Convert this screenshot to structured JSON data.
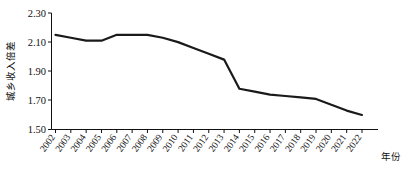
{
  "chart_data": {
    "type": "line",
    "title": "",
    "xlabel": "年份",
    "ylabel": "城乡收入倍差",
    "categories": [
      "2002",
      "2003",
      "2004",
      "2005",
      "2006",
      "2007",
      "2008",
      "2009",
      "2010",
      "2011",
      "2012",
      "2013",
      "2014",
      "2015",
      "2016",
      "2017",
      "2018",
      "2019",
      "2020",
      "2021",
      "2022"
    ],
    "values": [
      2.15,
      2.13,
      2.11,
      2.11,
      2.15,
      2.15,
      2.15,
      2.13,
      2.1,
      2.06,
      2.02,
      1.98,
      1.78,
      1.76,
      1.74,
      1.73,
      1.72,
      1.71,
      1.67,
      1.63,
      1.6
    ],
    "series": [
      {
        "name": "城乡收入倍差",
        "values": [
          2.15,
          2.13,
          2.11,
          2.11,
          2.15,
          2.15,
          2.15,
          2.13,
          2.1,
          2.06,
          2.02,
          1.98,
          1.78,
          1.76,
          1.74,
          1.73,
          1.72,
          1.71,
          1.67,
          1.63,
          1.6
        ]
      }
    ],
    "ylim": [
      1.5,
      2.3
    ],
    "yticks": [
      "2.30",
      "2.10",
      "1.90",
      "1.70",
      "1.50"
    ],
    "ytick_values": [
      2.3,
      2.1,
      1.9,
      1.7,
      1.5
    ],
    "grid": false,
    "legend": "none",
    "line_color": "#1a1a1a"
  },
  "axes": {
    "y_label": "城乡收入倍差",
    "x_label": "年份",
    "y_ticks": [
      "2.30",
      "2.10",
      "1.90",
      "1.70",
      "1.50"
    ],
    "x_ticks": [
      "2002",
      "2003",
      "2004",
      "2005",
      "2006",
      "2007",
      "2008",
      "2009",
      "2010",
      "2011",
      "2012",
      "2013",
      "2014",
      "2015",
      "2016",
      "2017",
      "2018",
      "2019",
      "2020",
      "2021",
      "2022"
    ]
  }
}
